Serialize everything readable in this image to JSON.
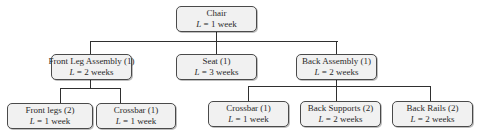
{
  "diagram": {
    "type": "product-structure-tree",
    "root": {
      "id": "chair",
      "name": "Chair",
      "lead_time_label": "L",
      "lead_time_value": "= 1 week"
    },
    "level2": [
      {
        "id": "front-leg-assembly",
        "name": "Front Leg Assembly (1)",
        "lead_time_label": "L",
        "lead_time_value": "= 2 weeks"
      },
      {
        "id": "seat",
        "name": "Seat (1)",
        "lead_time_label": "L",
        "lead_time_value": "= 3 weeks"
      },
      {
        "id": "back-assembly",
        "name": "Back Assembly (1)",
        "lead_time_label": "L",
        "lead_time_value": "= 2 weeks"
      }
    ],
    "level3": [
      {
        "id": "front-legs",
        "parent": "front-leg-assembly",
        "name": "Front legs (2)",
        "lead_time_label": "L",
        "lead_time_value": "= 1 week"
      },
      {
        "id": "crossbar-front",
        "parent": "front-leg-assembly",
        "name": "Crossbar (1)",
        "lead_time_label": "L",
        "lead_time_value": "= 1 week"
      },
      {
        "id": "crossbar-back",
        "parent": "back-assembly",
        "name": "Crossbar (1)",
        "lead_time_label": "L",
        "lead_time_value": "= 1 week"
      },
      {
        "id": "back-supports",
        "parent": "back-assembly",
        "name": "Back Supports (2)",
        "lead_time_label": "L",
        "lead_time_value": "= 2 weeks"
      },
      {
        "id": "back-rails",
        "parent": "back-assembly",
        "name": "Back Rails (2)",
        "lead_time_label": "L",
        "lead_time_value": "= 2 weeks"
      }
    ]
  },
  "colors": {
    "node_fill": "#f1f1f1",
    "node_border": "#4a4a4a",
    "connector": "#2f2f2f",
    "text": "#2a2a2a"
  }
}
